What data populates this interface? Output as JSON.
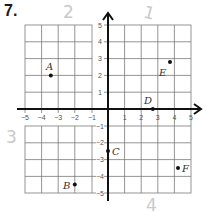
{
  "problem": {
    "number": "7."
  },
  "annotations": {
    "quadrant_2": "2",
    "quadrant_1": "1",
    "quadrant_3": "3",
    "quadrant_4": "4"
  },
  "axes": {
    "x_ticks": [
      "−5",
      "−4",
      "−3",
      "−2",
      "−1",
      "1",
      "2",
      "3",
      "4",
      "5"
    ],
    "y_ticks_upper": [
      "5",
      "4",
      "3",
      "2",
      "1"
    ],
    "y_ticks_lower": [
      "−1",
      "−2",
      "−3",
      "−4",
      "−5"
    ],
    "xlim": [
      -5,
      5
    ],
    "ylim": [
      -5,
      5
    ]
  },
  "points": [
    {
      "label": "A",
      "x": -3.5,
      "y": 2
    },
    {
      "label": "B",
      "x": -2,
      "y": -4.5
    },
    {
      "label": "C",
      "x": 0,
      "y": -2.5
    },
    {
      "label": "D",
      "x": 2.7,
      "y": 0
    },
    {
      "label": "E",
      "x": 3.8,
      "y": 2.8
    },
    {
      "label": "F",
      "x": 4.2,
      "y": -3.5
    }
  ]
}
